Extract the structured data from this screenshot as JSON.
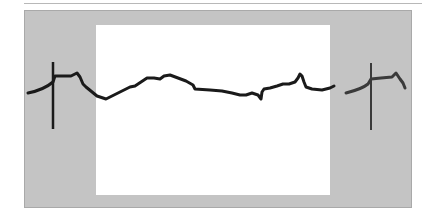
{
  "figure": {
    "colors": {
      "background": "#ffffff",
      "panel": "#c4c4c4",
      "window": "#ffffff",
      "trace": "#1a1a1a",
      "trace_right": "#3a3a3a",
      "rule": "#b8b8b8"
    },
    "markers": [
      {
        "name": "left-cursor",
        "x": 53,
        "y1": 62,
        "y2": 129
      },
      {
        "name": "right-cursor",
        "x": 371,
        "y1": 63,
        "y2": 130
      }
    ]
  }
}
